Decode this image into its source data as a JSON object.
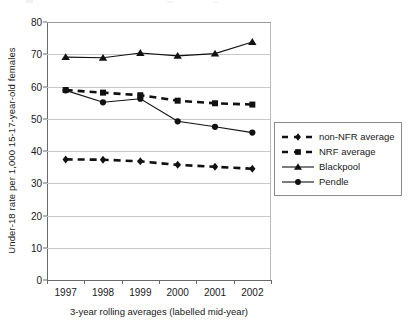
{
  "chart_data": {
    "type": "line",
    "title": "",
    "xlabel": "3-year rolling averages (labelled mid-year)",
    "ylabel": "Under-18 rate per 1,000 15-17-year-old females",
    "categories": [
      "1997",
      "1998",
      "1999",
      "2000",
      "2001",
      "2002"
    ],
    "ylim": [
      0,
      80
    ],
    "yticks": [
      0,
      10,
      20,
      30,
      40,
      50,
      60,
      70,
      80
    ],
    "ytick_labels": [
      "0",
      "10",
      "20",
      "30",
      "40",
      "50",
      "60",
      "70",
      "80"
    ],
    "grid": "horizontal",
    "legend_position": "right",
    "series": [
      {
        "name": "non-NFR average",
        "values": [
          37.4,
          37.3,
          36.8,
          35.7,
          35.1,
          34.5
        ],
        "marker": "diamond",
        "linestyle": "dashed",
        "color": "#111111"
      },
      {
        "name": "NRF average",
        "values": [
          58.9,
          58.1,
          57.3,
          55.6,
          54.8,
          54.4
        ],
        "marker": "square",
        "linestyle": "dashed",
        "color": "#111111"
      },
      {
        "name": "Blackpool",
        "values": [
          69.1,
          68.9,
          70.4,
          69.5,
          70.2,
          73.8
        ],
        "marker": "triangle",
        "linestyle": "solid",
        "color": "#111111"
      },
      {
        "name": "Pendle",
        "values": [
          58.8,
          55.1,
          56.2,
          49.2,
          47.5,
          45.7
        ],
        "marker": "circle",
        "linestyle": "solid",
        "color": "#111111"
      }
    ]
  },
  "axes": {
    "y_title": "Under-18 rate per 1,000 15-17-year-old females",
    "x_title": "3-year rolling averages (labelled mid-year)"
  },
  "legend": {
    "items": [
      {
        "label": "non-NFR average",
        "marker": "diamond",
        "linestyle": "dashed"
      },
      {
        "label": "NRF average",
        "marker": "square",
        "linestyle": "dashed"
      },
      {
        "label": "Blackpool",
        "marker": "triangle",
        "linestyle": "solid"
      },
      {
        "label": "Pendle",
        "marker": "circle",
        "linestyle": "solid"
      }
    ]
  }
}
